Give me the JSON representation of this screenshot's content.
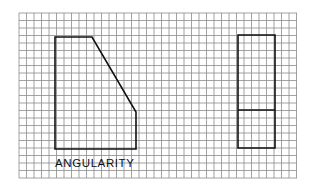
{
  "diagram": {
    "caption": "ANGULARITY",
    "grid": {
      "x0": 19,
      "y0": 13,
      "x1": 297,
      "y1": 178,
      "cell": 7.5,
      "line_color": "#8a8a8a",
      "background": "#ffffff"
    },
    "shapes": [
      {
        "name": "front-view-angled-block",
        "points": [
          [
            55,
            37
          ],
          [
            92,
            37
          ],
          [
            136,
            112
          ],
          [
            136,
            149
          ],
          [
            55,
            149
          ]
        ],
        "closed": true,
        "stroke": "#111111",
        "stroke_width": 1.6
      },
      {
        "name": "side-view-rectangle",
        "points": [
          [
            238,
            35
          ],
          [
            275,
            35
          ],
          [
            275,
            148
          ],
          [
            238,
            148
          ]
        ],
        "closed": true,
        "stroke": "#111111",
        "stroke_width": 1.6
      },
      {
        "name": "side-view-divider-line",
        "points": [
          [
            238,
            110
          ],
          [
            275,
            110
          ]
        ],
        "closed": false,
        "stroke": "#111111",
        "stroke_width": 1.6
      }
    ]
  }
}
